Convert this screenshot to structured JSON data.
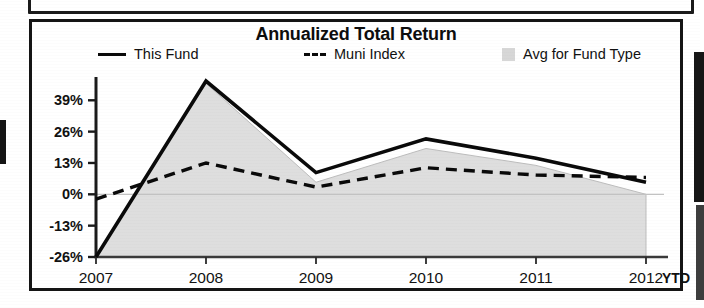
{
  "chart_data": {
    "type": "line",
    "title": "Annualized Total Return",
    "xlabel": "",
    "ylabel": "",
    "x": [
      "2007",
      "2008",
      "2009",
      "2010",
      "2011",
      "2012"
    ],
    "categories": [
      "2007",
      "2008",
      "2009",
      "2010",
      "2011",
      "2012"
    ],
    "ylim": [
      -26,
      47
    ],
    "yticks": [
      39,
      26,
      13,
      0,
      -13,
      -26
    ],
    "ytick_labels": [
      "39%",
      "26%",
      "13%",
      "0%",
      "-13%",
      "-26%"
    ],
    "grid": false,
    "legend_position": "top",
    "x_axis_suffix": "YTD",
    "series": [
      {
        "name": "This Fund",
        "style": "solid",
        "color": "#0a0a0a",
        "values": [
          -26,
          47,
          9,
          23,
          15,
          5
        ]
      },
      {
        "name": "Muni Index",
        "style": "dashed",
        "color": "#0a0a0a",
        "values": [
          -2,
          13,
          3,
          11,
          8,
          7
        ]
      },
      {
        "name": "Avg for Fund Type",
        "style": "filled-area",
        "color": "#c9c9c9",
        "values": [
          -26,
          46,
          5,
          19,
          12,
          0
        ]
      }
    ]
  },
  "legend": {
    "items": [
      {
        "label": "This Fund",
        "marker": "solid-line-swatch"
      },
      {
        "label": "Muni Index",
        "marker": "dashed-line-swatch"
      },
      {
        "label": "Avg for Fund Type",
        "marker": "gray-fill-swatch"
      }
    ]
  },
  "colors": {
    "frame": "#141414",
    "line": "#0a0a0a",
    "area_fill": "#c9c9c9",
    "background": "#ffffff"
  }
}
